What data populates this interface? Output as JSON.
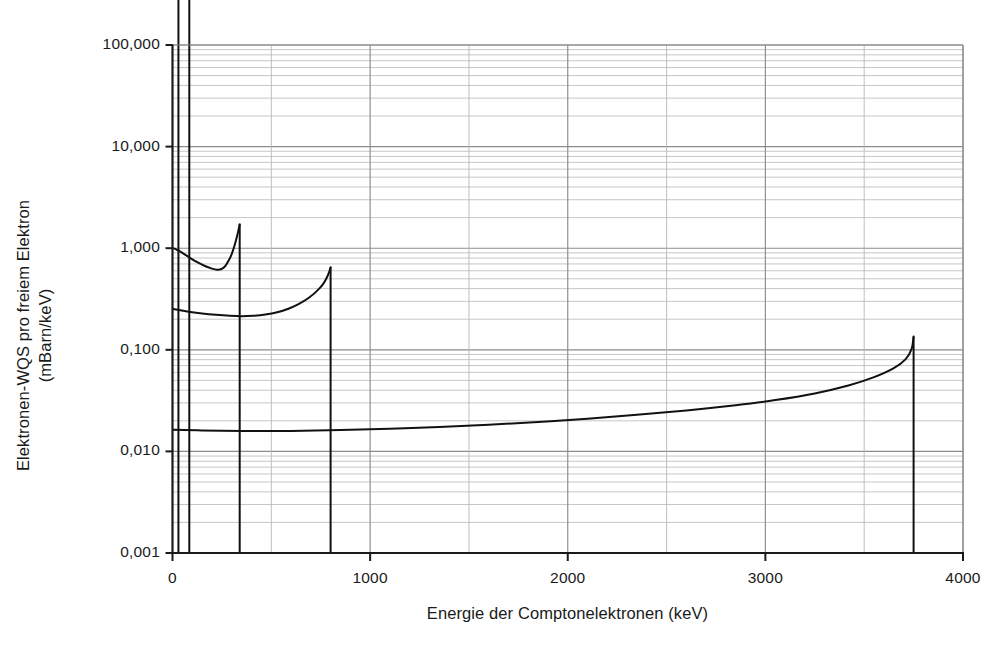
{
  "figure": {
    "kind": "line-chart",
    "background": "#ffffff",
    "ink": "#1a1a1a",
    "grid_major_color": "#8c8c8c",
    "grid_minor_color": "#b8b8b8",
    "axis_color": "#1a1a1a",
    "curve_color": "#111111"
  },
  "axes": {
    "x_title": "Energie der Comptonelektronen (keV)",
    "y_title_line1": "Elektronen-WQS pro freiem Elektron",
    "y_title_line2": "(mBarn/keV)",
    "x_tick_labels": [
      "0",
      "1000",
      "2000",
      "3000",
      "4000"
    ],
    "y_tick_labels": [
      "100,000",
      "10,000",
      "1,000",
      "0,100",
      "0,010",
      "0,001"
    ]
  },
  "chart_data": {
    "type": "line",
    "title": "",
    "subtitle": "",
    "xlabel": "Energie der Comptonelektronen (keV)",
    "ylabel": "Elektronen-WQS pro freiem Elektron (mBarn/keV)",
    "xlim": [
      0,
      4000
    ],
    "ylim": [
      0.001,
      100
    ],
    "yscale": "log",
    "xscale": "linear",
    "grid": true,
    "grid_minor_y": true,
    "legend": "none",
    "decimal_separator": ",",
    "x_ticks": [
      0,
      1000,
      2000,
      3000,
      4000
    ],
    "x_minor_ticks": [
      500,
      1500,
      2500,
      3500
    ],
    "y_ticks": [
      100,
      10,
      1,
      0.1,
      0.01,
      0.001
    ],
    "y_tick_text": [
      "100,000",
      "10,000",
      "1,000",
      "0,100",
      "0,010",
      "0,001"
    ],
    "note": "Klein-Nishina Compton electron energy distributions; each curve ends in a vertical Compton edge dropping to the axis floor.",
    "series": [
      {
        "name": "curve-edge-30keV",
        "compton_edge_keV": 30,
        "edge_value": 30000,
        "points": [
          [
            1,
            21000
          ],
          [
            3,
            20000
          ],
          [
            6,
            16000
          ],
          [
            10,
            11000
          ],
          [
            14,
            8000
          ],
          [
            18,
            6200
          ],
          [
            22,
            5200
          ],
          [
            25,
            4800
          ],
          [
            27,
            5400
          ],
          [
            28,
            8000
          ],
          [
            29,
            16000
          ],
          [
            30,
            28000
          ]
        ]
      },
      {
        "name": "curve-edge-85keV",
        "compton_edge_keV": 85,
        "edge_value": 7600,
        "points": [
          [
            2,
            9500
          ],
          [
            8,
            8600
          ],
          [
            16,
            7200
          ],
          [
            26,
            5700
          ],
          [
            38,
            4500
          ],
          [
            50,
            3800
          ],
          [
            58,
            3500
          ],
          [
            64,
            3450
          ],
          [
            70,
            3900
          ],
          [
            76,
            5000
          ],
          [
            81,
            6300
          ],
          [
            85,
            7600
          ]
        ]
      },
      {
        "name": "curve-edge-340keV",
        "compton_edge_keV": 340,
        "edge_value": 1.72,
        "points": [
          [
            3,
            1.0
          ],
          [
            20,
            0.97
          ],
          [
            50,
            0.9
          ],
          [
            90,
            0.8
          ],
          [
            130,
            0.72
          ],
          [
            170,
            0.66
          ],
          [
            200,
            0.63
          ],
          [
            225,
            0.615
          ],
          [
            245,
            0.62
          ],
          [
            265,
            0.66
          ],
          [
            285,
            0.76
          ],
          [
            300,
            0.88
          ],
          [
            315,
            1.08
          ],
          [
            328,
            1.35
          ],
          [
            336,
            1.58
          ],
          [
            340,
            1.72
          ]
        ]
      },
      {
        "name": "curve-edge-800keV",
        "compton_edge_keV": 800,
        "edge_value": 0.65,
        "points": [
          [
            3,
            0.252
          ],
          [
            40,
            0.245
          ],
          [
            90,
            0.236
          ],
          [
            150,
            0.228
          ],
          [
            220,
            0.221
          ],
          [
            290,
            0.216
          ],
          [
            350,
            0.214
          ],
          [
            410,
            0.216
          ],
          [
            470,
            0.222
          ],
          [
            530,
            0.234
          ],
          [
            590,
            0.255
          ],
          [
            640,
            0.283
          ],
          [
            690,
            0.325
          ],
          [
            730,
            0.378
          ],
          [
            760,
            0.438
          ],
          [
            780,
            0.508
          ],
          [
            793,
            0.585
          ],
          [
            800,
            0.65
          ]
        ]
      },
      {
        "name": "curve-edge-3750keV",
        "compton_edge_keV": 3750,
        "edge_value": 0.135,
        "points": [
          [
            3,
            0.0163
          ],
          [
            150,
            0.0161
          ],
          [
            350,
            0.0159
          ],
          [
            600,
            0.0159
          ],
          [
            850,
            0.0162
          ],
          [
            1100,
            0.0167
          ],
          [
            1350,
            0.0174
          ],
          [
            1600,
            0.0183
          ],
          [
            1850,
            0.0195
          ],
          [
            2100,
            0.021
          ],
          [
            2350,
            0.0229
          ],
          [
            2600,
            0.0253
          ],
          [
            2850,
            0.0285
          ],
          [
            3050,
            0.032
          ],
          [
            3250,
            0.0372
          ],
          [
            3420,
            0.0445
          ],
          [
            3550,
            0.0538
          ],
          [
            3650,
            0.066
          ],
          [
            3710,
            0.081
          ],
          [
            3740,
            0.102
          ],
          [
            3750,
            0.135
          ]
        ]
      }
    ],
    "vertical_edges": [
      {
        "name": "edge-drop-30keV",
        "x": 30,
        "from": 30000,
        "to": 0.001
      },
      {
        "name": "edge-drop-85keV",
        "x": 85,
        "from": 7600,
        "to": 0.001
      },
      {
        "name": "edge-drop-340keV",
        "x": 340,
        "from": 1.72,
        "to": 0.001
      },
      {
        "name": "edge-drop-800keV",
        "x": 800,
        "from": 0.65,
        "to": 0.001
      },
      {
        "name": "edge-drop-3750keV",
        "x": 3750,
        "from": 0.135,
        "to": 0.001
      }
    ]
  }
}
